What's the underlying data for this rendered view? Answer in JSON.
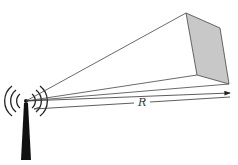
{
  "diagram": {
    "labels": {
      "range": "R"
    },
    "colors": {
      "line": "#444444",
      "face": "#c8c8c8",
      "tower": "#111111"
    },
    "elements": [
      "antenna-tower",
      "radio-waves",
      "beam-lines",
      "target-face",
      "range-arrow"
    ]
  }
}
